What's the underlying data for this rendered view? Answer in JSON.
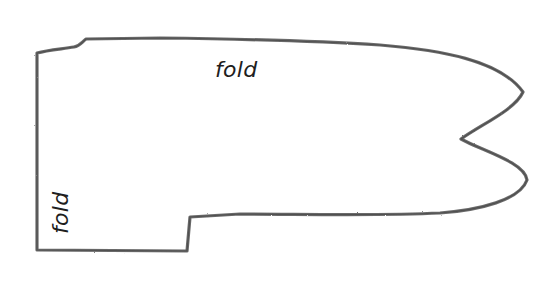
{
  "diagram": {
    "type": "sewing-pattern-outline",
    "stroke_color": "#6a6a6a",
    "background_color": "#ffffff",
    "labels": {
      "top_fold": "fold",
      "side_fold": "fold"
    }
  }
}
